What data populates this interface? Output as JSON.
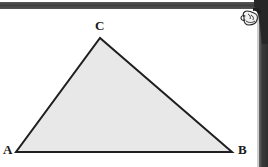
{
  "figure": {
    "background_color": "#ffffff",
    "fill_color": "#e8e8e8",
    "stroke_color": "#1f1f1f",
    "stroke_width": 2,
    "vertices": [
      {
        "label": "A",
        "x": 16,
        "y": 152
      },
      {
        "label": "B",
        "x": 232,
        "y": 152
      },
      {
        "label": "C",
        "x": 100,
        "y": 38
      }
    ],
    "labels": {
      "a": "A",
      "b": "B",
      "c": "C"
    }
  },
  "scan_artifacts": {
    "top_bar": {
      "name": "page-edge-shadow-top",
      "color": "#3f3f3f"
    },
    "right_bar": {
      "name": "page-edge-shadow-right",
      "color": "#2e2e2e"
    },
    "hand": {
      "name": "pointing-hand-illustration",
      "color": "#262626"
    }
  }
}
